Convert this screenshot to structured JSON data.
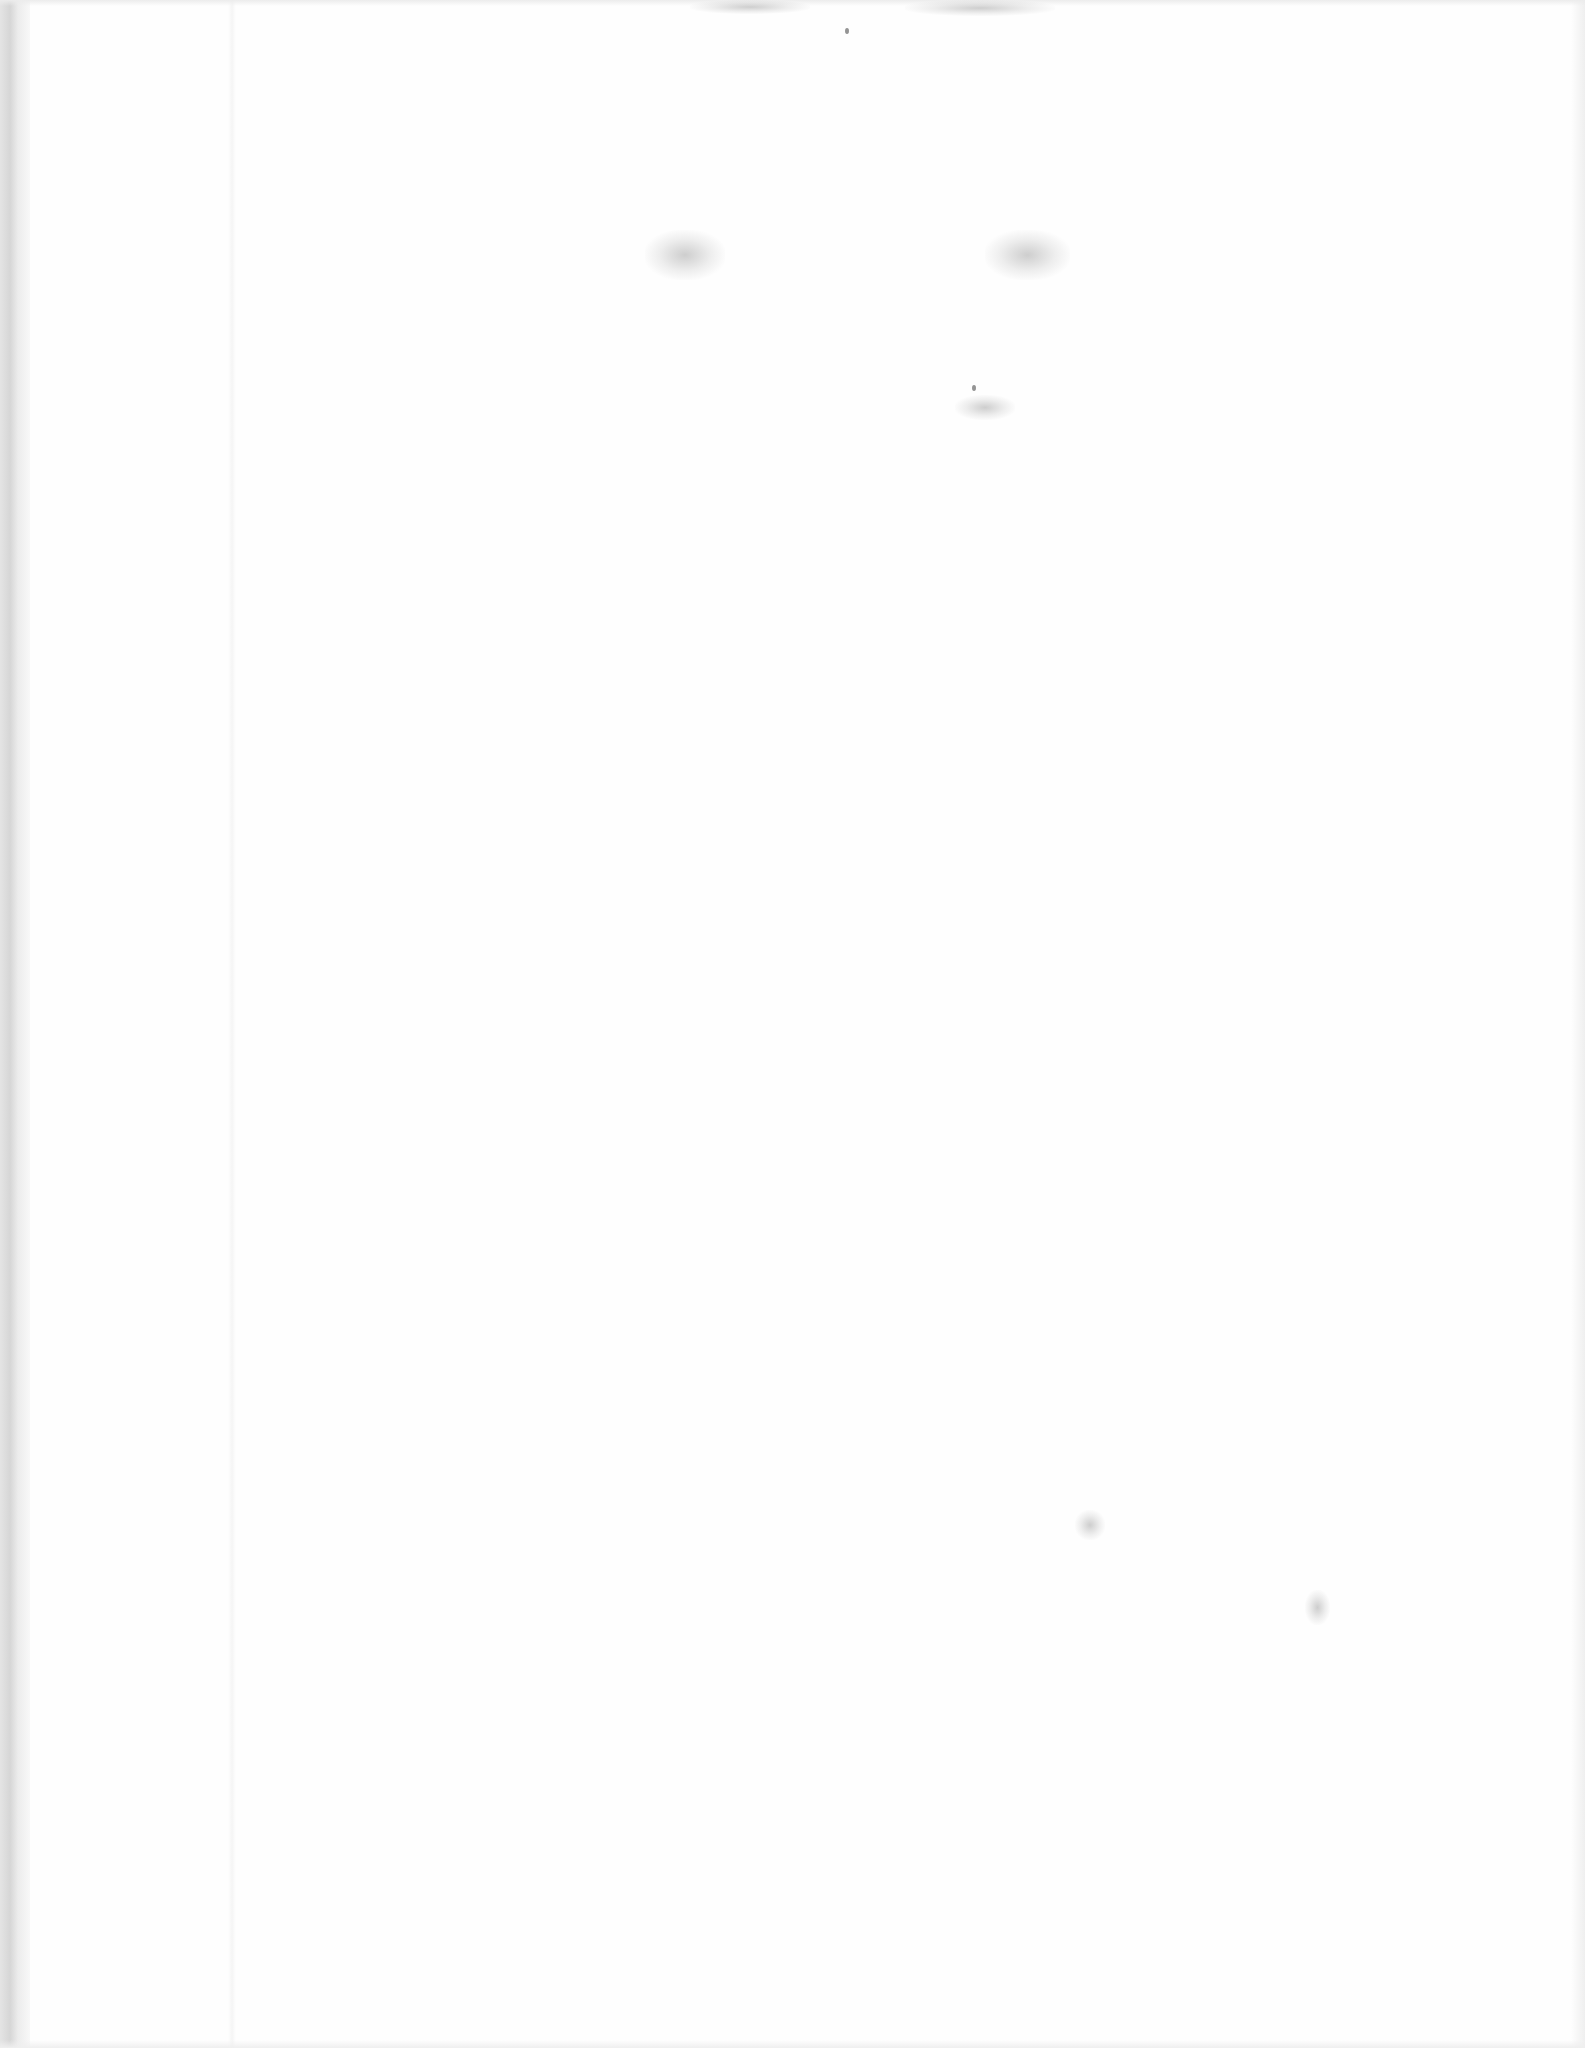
{
  "document": {
    "type": "blank scanned page",
    "text_content": "",
    "background_color": "#fefefe"
  },
  "artifacts": {
    "top_bleed_through": [
      {
        "x": 690,
        "y": 0,
        "w": 120,
        "h": 14
      },
      {
        "x": 905,
        "y": 0,
        "w": 150,
        "h": 16
      }
    ],
    "mid_smudges": [
      {
        "x": 645,
        "y": 230,
        "w": 80,
        "h": 50
      },
      {
        "x": 985,
        "y": 230,
        "w": 85,
        "h": 50
      },
      {
        "x": 955,
        "y": 395,
        "w": 60,
        "h": 25
      },
      {
        "x": 1075,
        "y": 1510,
        "w": 30,
        "h": 30
      },
      {
        "x": 1305,
        "y": 1590,
        "w": 25,
        "h": 35
      }
    ],
    "specks": [
      {
        "x": 845,
        "y": 28
      },
      {
        "x": 972,
        "y": 385
      }
    ]
  }
}
